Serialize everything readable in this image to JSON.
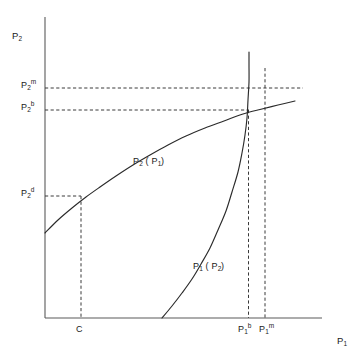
{
  "figure": {
    "background_color": "#ffffff",
    "line_color": "#2b2b2b",
    "axis_color": "#5a5a5a",
    "text_color": "#1a1a1a"
  },
  "axes": {
    "y_axis_title_base": "P",
    "y_axis_title_sub": "2",
    "x_axis_title_base": "P",
    "x_axis_title_sub": "1"
  },
  "y_ticks": [
    {
      "base": "P",
      "sub": "2",
      "sup": "m",
      "text": "P2m"
    },
    {
      "base": "P",
      "sub": "2",
      "sup": "b",
      "text": "P2b"
    },
    {
      "base": "P",
      "sub": "2",
      "sup": "d",
      "text": "P2d"
    }
  ],
  "x_ticks": [
    {
      "base": "C",
      "sub": "",
      "sup": "",
      "text": "C"
    },
    {
      "base": "P",
      "sub": "1",
      "sup": "b",
      "text": "P1b"
    },
    {
      "base": "P",
      "sub": "1",
      "sup": "m",
      "text": "P1m"
    }
  ],
  "curves": [
    {
      "name": "best-response-firm-2",
      "label_base": "P",
      "label_sub": "2",
      "label_arg_open": "(",
      "label_arg_base": "P",
      "label_arg_sub": "1",
      "label_arg_close": ")",
      "text": "P2 ( P1 )"
    },
    {
      "name": "best-response-firm-1",
      "label_base": "P",
      "label_sub": "1",
      "label_arg_open": "(",
      "label_arg_base": "P",
      "label_arg_sub": "2",
      "label_arg_close": ")",
      "text": "P1 ( P2 )"
    }
  ],
  "chart_data": {
    "type": "line",
    "title": "",
    "xlabel": "P1",
    "ylabel": "P2",
    "grid": false,
    "legend": "none",
    "xlim": [
      0,
      1
    ],
    "ylim": [
      0,
      1
    ],
    "annotations": [
      {
        "name": "equilibrium-point",
        "label": "",
        "x_tick": "P1b",
        "y_tick": "P2b"
      },
      {
        "name": "monopoly-reference",
        "label": "",
        "x_tick": "P1m",
        "y_tick": "P2m"
      },
      {
        "name": "cost-reference",
        "label": "",
        "x_tick": "C",
        "y_tick": "P2d"
      }
    ],
    "series": [
      {
        "name": "P2 ( P1 )",
        "description": "concave increasing best-response of firm 2",
        "points": [
          [
            45,
            233
          ],
          [
            58,
            220
          ],
          [
            72,
            208
          ],
          [
            86,
            197
          ],
          [
            100,
            187
          ],
          [
            116,
            176
          ],
          [
            133,
            165
          ],
          [
            150,
            155
          ],
          [
            168,
            145
          ],
          [
            186,
            136
          ],
          [
            205,
            128
          ],
          [
            224,
            121
          ],
          [
            243,
            114
          ],
          [
            262,
            109
          ],
          [
            278,
            105
          ],
          [
            295,
            101
          ]
        ]
      },
      {
        "name": "P1 ( P2 )",
        "description": "steep increasing best-response of firm 1",
        "points": [
          [
            162,
            318
          ],
          [
            172,
            306
          ],
          [
            182,
            293
          ],
          [
            192,
            279
          ],
          [
            201,
            264
          ],
          [
            210,
            248
          ],
          [
            218,
            230
          ],
          [
            226,
            211
          ],
          [
            232,
            192
          ],
          [
            238,
            172
          ],
          [
            242,
            153
          ],
          [
            245,
            135
          ],
          [
            247,
            118
          ],
          [
            248,
            100
          ],
          [
            249,
            82
          ],
          [
            249,
            65
          ],
          [
            249,
            52
          ]
        ]
      }
    ],
    "guide_lines": [
      {
        "name": "P2m-horizontal",
        "orientation": "horizontal",
        "from": [
          45,
          88
        ],
        "to": [
          303,
          88
        ],
        "style": "dashed"
      },
      {
        "name": "P2b-horizontal",
        "orientation": "horizontal",
        "from": [
          45,
          110
        ],
        "to": [
          248,
          110
        ],
        "style": "dashed"
      },
      {
        "name": "P2d-horizontal",
        "orientation": "horizontal",
        "from": [
          45,
          196
        ],
        "to": [
          81,
          196
        ],
        "style": "dashed"
      },
      {
        "name": "C-vertical",
        "orientation": "vertical",
        "from": [
          81,
          196
        ],
        "to": [
          81,
          318
        ],
        "style": "dashed"
      },
      {
        "name": "P1b-vertical",
        "orientation": "vertical",
        "from": [
          248,
          110
        ],
        "to": [
          248,
          318
        ],
        "style": "dashed"
      },
      {
        "name": "P1m-vertical",
        "orientation": "vertical",
        "from": [
          265,
          68
        ],
        "to": [
          265,
          318
        ],
        "style": "dashed"
      }
    ]
  }
}
